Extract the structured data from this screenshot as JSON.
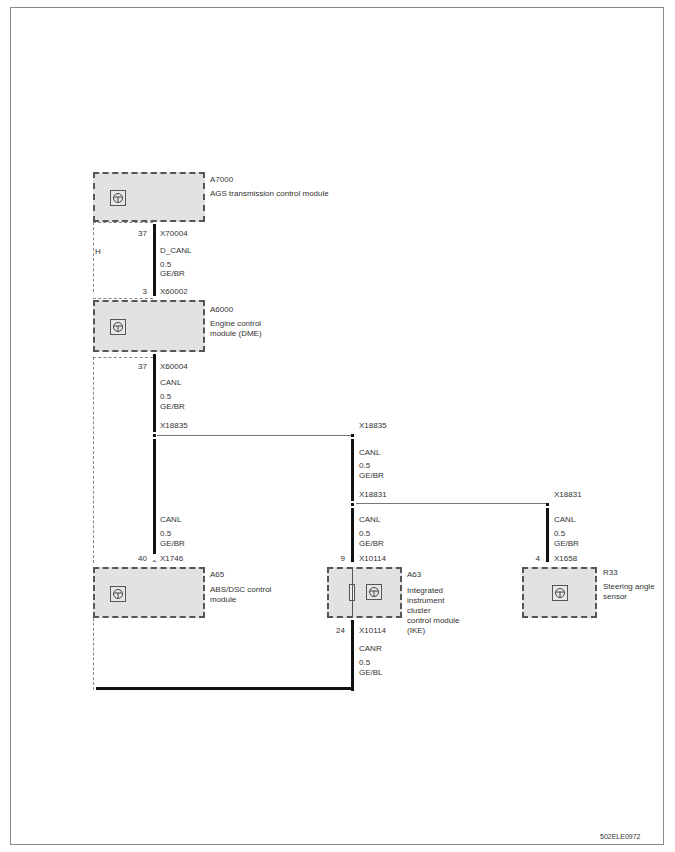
{
  "diagram": {
    "ref_code": "502ELE0972",
    "modules": [
      {
        "id": "A7000",
        "name": "AGS transmission control module",
        "icon": "ecu-icon"
      },
      {
        "id": "A6000",
        "name_lines": [
          "Engine control",
          "module  (DME)"
        ],
        "icon": "ecu-icon"
      },
      {
        "id": "A65",
        "name_lines": [
          "ABS/DSC control",
          "module"
        ],
        "icon": "ecu-icon"
      },
      {
        "id": "A63",
        "name_lines": [
          "Integrated",
          "instrument",
          "cluster",
          "control module",
          "(IKE)"
        ],
        "icon": "ecu-icon"
      },
      {
        "id": "R33",
        "name_lines": [
          "Steering angle",
          "sensor"
        ],
        "icon": "ecu-icon"
      }
    ],
    "side_label": "H",
    "wires": [
      {
        "pin_top": "37",
        "conn_top": "X70004",
        "signal": "D_CANL",
        "size": "0.5",
        "color": "GE/BR",
        "pin_bottom": "3",
        "conn_bottom": "X60002"
      },
      {
        "pin_top": "37",
        "conn_top": "X60004",
        "signal": "CANL",
        "size": "0.5",
        "color": "GE/BR",
        "splice": "X18835"
      },
      {
        "splice_top": "X18835",
        "signal": "CANL",
        "size": "0.5",
        "color": "GE/BR",
        "splice_bottom": "X18831"
      },
      {
        "signal": "CANL",
        "size": "0.5",
        "color": "GE/BR",
        "pin": "40",
        "conn": "X1746"
      },
      {
        "signal": "CANL",
        "size": "0.5",
        "color": "GE/BR",
        "pin": "9",
        "conn": "X10114"
      },
      {
        "splice_top": "X18831",
        "signal": "CANL",
        "size": "0.5",
        "color": "GE/BR",
        "pin": "4",
        "conn": "X1658"
      },
      {
        "pin": "24",
        "conn": "X10114",
        "signal": "CANR",
        "size": "0.5",
        "color": "GE/BL"
      }
    ]
  }
}
